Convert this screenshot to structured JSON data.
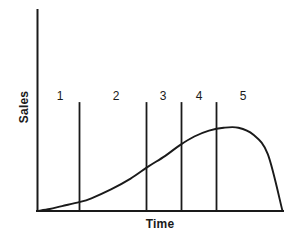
{
  "figure": {
    "background_color": "#ffffff",
    "line_color": "#1a1a1a",
    "axis_color": "#1a1a1a"
  },
  "axes": {
    "ylabel": "Sales",
    "xlabel": "Time"
  },
  "chart_data": {
    "type": "line",
    "title": "",
    "xlabel": "Time",
    "ylabel": "Sales",
    "xlim": [
      0,
      100
    ],
    "ylim": [
      0,
      100
    ],
    "grid": false,
    "legend": false,
    "series": [
      {
        "name": "Sales",
        "x": [
          0,
          5,
          10,
          17,
          22,
          30,
          38,
          45,
          52,
          58,
          64,
          70,
          76,
          82,
          88,
          94,
          100
        ],
        "y": [
          0,
          2,
          5,
          9,
          13,
          22,
          33,
          45,
          56,
          67,
          76,
          82,
          85,
          85,
          78,
          58,
          0
        ]
      }
    ],
    "stage_dividers": [
      17,
      45,
      59,
      73
    ],
    "stage_labels": [
      {
        "label": "1",
        "x": 9
      },
      {
        "label": "2",
        "x": 31
      },
      {
        "label": "3",
        "x": 51
      },
      {
        "label": "4",
        "x": 66
      },
      {
        "label": "5",
        "x": 84
      }
    ],
    "annotations": []
  },
  "stages": [
    {
      "label": "1",
      "left_px": 51,
      "top_px": 89
    },
    {
      "label": "2",
      "left_px": 107,
      "top_px": 89
    },
    {
      "label": "3",
      "left_px": 154,
      "top_px": 89
    },
    {
      "label": "4",
      "left_px": 190,
      "top_px": 89
    },
    {
      "label": "5",
      "left_px": 234,
      "top_px": 89
    }
  ]
}
